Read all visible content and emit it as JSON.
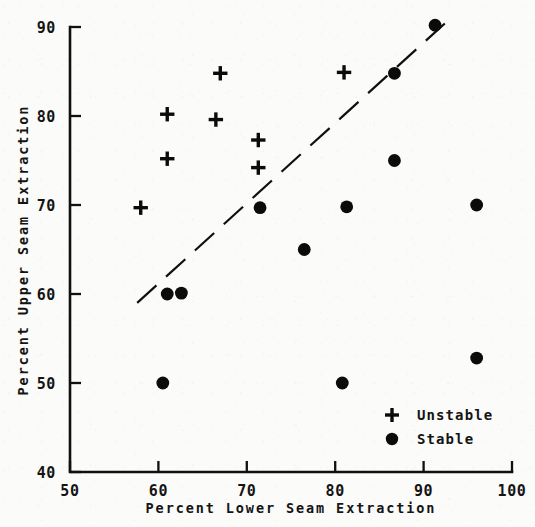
{
  "chart_data": {
    "type": "scatter",
    "title": "",
    "xlabel": "Percent Lower Seam Extraction",
    "ylabel": "Percent Upper Seam Extraction",
    "xlim": [
      50,
      100
    ],
    "ylim": [
      40,
      90
    ],
    "xticks": [
      50,
      60,
      70,
      80,
      90,
      100
    ],
    "yticks": [
      40,
      50,
      60,
      70,
      80,
      90
    ],
    "xtick_labels": [
      "50",
      "60",
      "70",
      "80",
      "90",
      "100"
    ],
    "ytick_labels": [
      "40",
      "50",
      "60",
      "70",
      "80",
      "90"
    ],
    "grid": false,
    "legend_position": "lower right",
    "series": [
      {
        "name": "Unstable",
        "marker": "plus",
        "color": "#0b0b0b",
        "points": [
          {
            "x": 58.0,
            "y": 69.7
          },
          {
            "x": 61.0,
            "y": 80.2
          },
          {
            "x": 61.0,
            "y": 75.2
          },
          {
            "x": 66.5,
            "y": 79.6
          },
          {
            "x": 67.0,
            "y": 84.8
          },
          {
            "x": 71.3,
            "y": 77.3
          },
          {
            "x": 71.3,
            "y": 74.2
          },
          {
            "x": 81.0,
            "y": 84.9
          }
        ]
      },
      {
        "name": "Stable",
        "marker": "filled-circle",
        "color": "#0b0b0b",
        "points": [
          {
            "x": 60.5,
            "y": 50.0
          },
          {
            "x": 61.0,
            "y": 60.0
          },
          {
            "x": 62.6,
            "y": 60.1
          },
          {
            "x": 71.5,
            "y": 69.7
          },
          {
            "x": 76.5,
            "y": 65.0
          },
          {
            "x": 80.8,
            "y": 50.0
          },
          {
            "x": 81.3,
            "y": 69.8
          },
          {
            "x": 86.7,
            "y": 84.8
          },
          {
            "x": 86.7,
            "y": 75.0
          },
          {
            "x": 91.3,
            "y": 90.2
          },
          {
            "x": 96.0,
            "y": 70.0
          },
          {
            "x": 96.0,
            "y": 52.8
          }
        ]
      }
    ],
    "annotations": [
      {
        "type": "dashed-trend-line",
        "x_start": 57.6,
        "y_start": 59.0,
        "x_end": 92.4,
        "y_end": 90.4
      }
    ]
  },
  "legend": {
    "entries": [
      {
        "label": "Unstable",
        "marker": "plus"
      },
      {
        "label": "Stable",
        "marker": "filled-circle"
      }
    ]
  },
  "axes": {
    "x_title": "Percent Lower Seam Extraction",
    "y_title": "Percent Upper Seam Extraction"
  }
}
